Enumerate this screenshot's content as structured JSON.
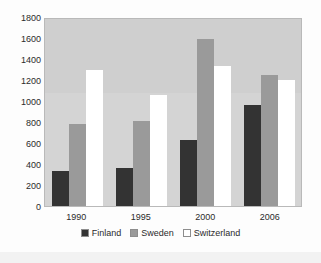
{
  "chart_data": {
    "type": "bar",
    "title": "",
    "subtitle": "",
    "xlabel": "",
    "ylabel": "",
    "categories": [
      "1990",
      "1995",
      "2000",
      "2006"
    ],
    "series": [
      {
        "name": "Finland",
        "color": "#333333",
        "values": [
          330,
          360,
          630,
          960
        ]
      },
      {
        "name": "Sweden",
        "color": "#9a9a9a",
        "values": [
          780,
          805,
          1590,
          1250
        ]
      },
      {
        "name": "Switzerland",
        "color": "#ffffff",
        "values": [
          1300,
          1060,
          1330,
          1200
        ]
      }
    ],
    "ylim": [
      0,
      1800
    ],
    "ytick_labels": [
      "1800",
      "1600",
      "1400",
      "1200",
      "1000",
      "800",
      "600",
      "400",
      "200",
      "0"
    ],
    "ytick_values": [
      1800,
      1600,
      1400,
      1200,
      1000,
      800,
      600,
      400,
      200,
      0
    ],
    "grid": false,
    "legend_position": "bottom",
    "plot_background": "#d4d4d4",
    "figure_background": "#fdfdfd"
  }
}
